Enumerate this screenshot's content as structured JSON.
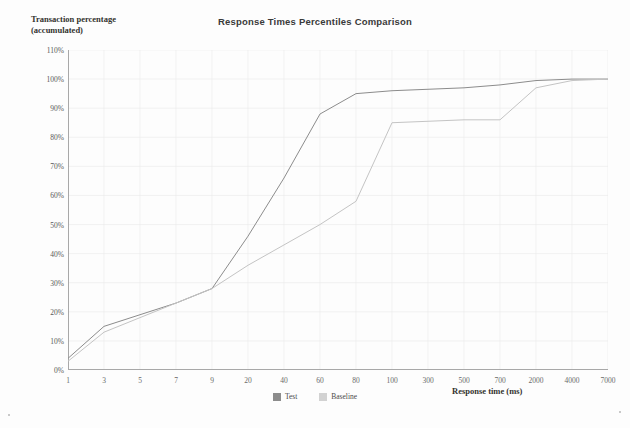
{
  "chart_data": {
    "type": "line",
    "title": "Response Times Percentiles Comparison",
    "ylabel_line1": "Transaction percentage",
    "ylabel_line2": "(accumulated)",
    "xlabel": "Response time (ms)",
    "grid": true,
    "legend_position": "bottom-center",
    "ylim": [
      0,
      110
    ],
    "yticks": [
      "0%",
      "10%",
      "20%",
      "30%",
      "40%",
      "50%",
      "60%",
      "70%",
      "80%",
      "90%",
      "100%",
      "110%"
    ],
    "ytick_values": [
      0,
      10,
      20,
      30,
      40,
      50,
      60,
      70,
      80,
      90,
      100,
      110
    ],
    "xticks": [
      "1",
      "3",
      "5",
      "7",
      "9",
      "20",
      "40",
      "60",
      "80",
      "100",
      "300",
      "500",
      "700",
      "2000",
      "4000",
      "7000"
    ],
    "x": [
      1,
      3,
      5,
      7,
      9,
      20,
      40,
      60,
      80,
      100,
      300,
      500,
      700,
      2000,
      4000,
      7000
    ],
    "series": [
      {
        "name": "Test",
        "color": "#8c8c8c",
        "values": [
          4,
          15,
          19,
          23,
          28,
          46,
          66,
          88,
          95,
          96,
          96.5,
          97,
          98,
          99.5,
          100,
          100
        ]
      },
      {
        "name": "Baseline",
        "color": "#c4c4c4",
        "values": [
          3,
          13,
          18,
          23,
          28,
          36,
          43,
          50,
          58,
          85,
          85.5,
          86,
          86,
          97,
          99.5,
          100
        ]
      }
    ]
  },
  "legend": {
    "items": [
      {
        "label": "Test",
        "color": "#8c8c8c"
      },
      {
        "label": "Baseline",
        "color": "#d2d2d2"
      }
    ]
  },
  "colors": {
    "axis": "#a8a8a8",
    "grid": "#ededed",
    "tick_text": "#585858",
    "title_text": "#3a3a3a",
    "background": "#fdfdfd"
  }
}
